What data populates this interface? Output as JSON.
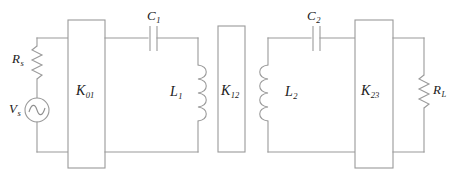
{
  "figure": {
    "kind": "circuit-schematic",
    "title": "",
    "background_color": "#ffffff",
    "line_color": "#9a9a9a",
    "text_color": "#1a1a1a",
    "width": 455,
    "height": 169
  },
  "components": {
    "source_resistor": {
      "label": "R",
      "subscript": "s",
      "symbol": "zigzag-resistor"
    },
    "voltage_source": {
      "label": "V",
      "subscript": "s",
      "symbol": "ac-source"
    },
    "inverter_k01": {
      "label": "K",
      "subscript": "01",
      "symbol": "impedance-inverter-box"
    },
    "capacitor_c1": {
      "label": "C",
      "subscript": "1",
      "symbol": "capacitor-plates"
    },
    "inductor_l1": {
      "label": "L",
      "subscript": "1",
      "symbol": "coil-inductor"
    },
    "inverter_k12": {
      "label": "K",
      "subscript": "12",
      "symbol": "impedance-inverter-box"
    },
    "inductor_l2": {
      "label": "L",
      "subscript": "2",
      "symbol": "coil-inductor"
    },
    "capacitor_c2": {
      "label": "C",
      "subscript": "2",
      "symbol": "capacitor-plates"
    },
    "inverter_k23": {
      "label": "K",
      "subscript": "23",
      "symbol": "impedance-inverter-box"
    },
    "load_resistor": {
      "label": "R",
      "subscript": "L",
      "symbol": "zigzag-resistor"
    }
  }
}
